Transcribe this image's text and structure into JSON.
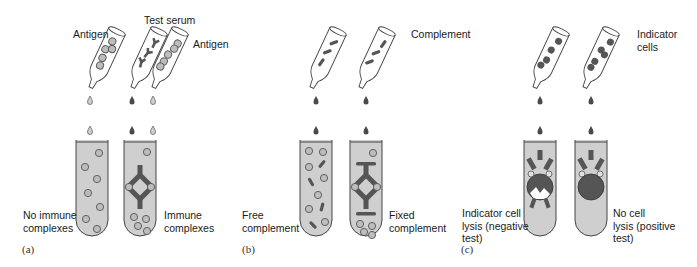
{
  "figure": {
    "panels": [
      {
        "id": "a",
        "panel_label": "(a)",
        "pipette_labels": {
          "antigen_left": "Antigen",
          "test_serum": "Test serum",
          "antigen_right": "Antigen"
        },
        "tube_labels": {
          "left": "No immune\ncomplexes",
          "right": "Immune\ncomplexes"
        }
      },
      {
        "id": "b",
        "panel_label": "(b)",
        "pipette_labels": {
          "complement": "Complement"
        },
        "tube_labels": {
          "left": "Free\ncomplement",
          "right": "Fixed\ncomplement"
        }
      },
      {
        "id": "c",
        "panel_label": "(c)",
        "pipette_labels": {
          "indicator_cells": "Indicator\ncells"
        },
        "tube_labels": {
          "left": "Indicator cell\nlysis (negative\ntest)",
          "right": "No cell\nlysis (positive\ntest)"
        }
      }
    ],
    "colors": {
      "tube_fill": "#cfcfcf",
      "outline": "#444444",
      "dark_element": "#555555",
      "antigen_fill": "#bdbdbd",
      "background": "#ffffff"
    }
  }
}
